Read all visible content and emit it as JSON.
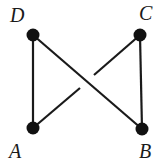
{
  "diagram": {
    "type": "graph",
    "nodes": [
      {
        "id": "D",
        "label": "D",
        "x": 33,
        "y": 35,
        "label_x": 10,
        "label_y": 22
      },
      {
        "id": "C",
        "label": "C",
        "x": 140,
        "y": 35,
        "label_x": 139,
        "label_y": 20
      },
      {
        "id": "A",
        "label": "A",
        "x": 33,
        "y": 128,
        "label_x": 9,
        "label_y": 158
      },
      {
        "id": "B",
        "label": "B",
        "x": 142,
        "y": 129,
        "label_x": 139,
        "label_y": 158
      }
    ],
    "edges": [
      {
        "from": "D",
        "to": "A",
        "style": "solid"
      },
      {
        "from": "C",
        "to": "B",
        "style": "solid"
      },
      {
        "from": "D",
        "to": "B",
        "style": "solid",
        "over": true
      },
      {
        "from": "C",
        "to": "A",
        "style": "broken-at-crossing",
        "under": true
      }
    ],
    "colors": {
      "stroke": "#1a1a1a",
      "node": "#111111",
      "background": "#ffffff"
    }
  }
}
